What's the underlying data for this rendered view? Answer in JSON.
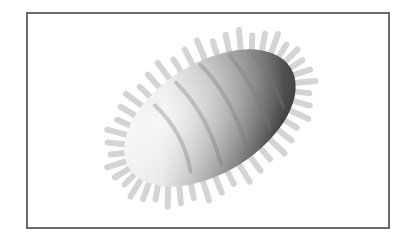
{
  "figure": {
    "colors": {
      "frame_border": "#6a6a6a",
      "background": "#ffffff",
      "body_light": "#f2f2f2",
      "body_dark": "#4a4a4a",
      "spike": "#dcdcdc"
    },
    "body": {
      "cx": 210,
      "cy": 118,
      "rx": 95,
      "ry": 55,
      "rotation_deg": -32
    }
  }
}
